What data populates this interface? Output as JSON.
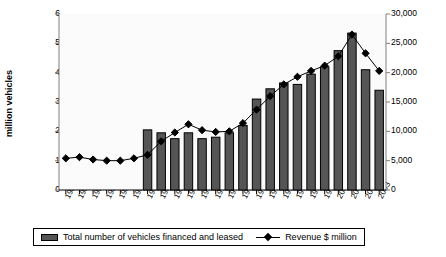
{
  "chart_data": {
    "type": "bar",
    "title": "",
    "xlabel": "",
    "ylabel": "million vehicles",
    "ylabel_right": "",
    "grid": false,
    "legend_position": "bottom",
    "categories": [
      "1980",
      "1981",
      "1982",
      "1983",
      "1984",
      "1985",
      "1986",
      "1987",
      "1988",
      "1989",
      "1990",
      "1991",
      "1992",
      "1993",
      "1994",
      "1995",
      "1996",
      "1997",
      "1998",
      "1999",
      "2000",
      "2001",
      "2002",
      "2003"
    ],
    "ylim": [
      0,
      6
    ],
    "yticks": [
      "0",
      "1",
      "2",
      "3",
      "4",
      "5",
      "6"
    ],
    "ylim_right": [
      0,
      30000
    ],
    "yticks_right": [
      "0",
      "5,000",
      "10,000",
      "15,000",
      "20,000",
      "25,000",
      "30,000"
    ],
    "series": [
      {
        "name": "Total number of vehicles financed and leased",
        "type": "bar",
        "axis": "left",
        "units": "million vehicles",
        "color": "#555555",
        "values": [
          null,
          null,
          null,
          null,
          null,
          null,
          2.05,
          1.95,
          1.75,
          1.95,
          1.75,
          1.8,
          1.95,
          2.2,
          3.1,
          3.45,
          3.65,
          3.6,
          3.95,
          4.2,
          4.75,
          5.35,
          4.1,
          3.4
        ]
      },
      {
        "name": "Revenue $ million",
        "type": "line",
        "axis": "right",
        "units": "$ million",
        "color": "#000000",
        "marker": "diamond",
        "values": [
          5400,
          5600,
          5200,
          5000,
          5000,
          5400,
          6000,
          8300,
          9800,
          11200,
          10200,
          9900,
          10000,
          11400,
          13700,
          16000,
          18000,
          19300,
          20300,
          21200,
          22800,
          26500,
          23300,
          20300
        ]
      }
    ]
  },
  "legend": {
    "bars_label": "Total number of vehicles financed and leased",
    "line_label": "Revenue $ million"
  },
  "icons": {
    "bar_swatch": "bar-swatch-icon",
    "line_marker": "diamond-marker-icon"
  }
}
